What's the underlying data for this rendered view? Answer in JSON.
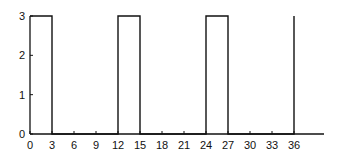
{
  "chart_data": {
    "type": "line",
    "title": "",
    "xlabel": "",
    "ylabel": "",
    "xlim": [
      0,
      40
    ],
    "ylim": [
      0,
      3
    ],
    "grid": false,
    "legend": null,
    "x_ticks": [
      0,
      3,
      6,
      9,
      12,
      15,
      18,
      21,
      24,
      27,
      30,
      33,
      36
    ],
    "y_ticks": [
      0,
      1,
      2,
      3
    ],
    "series": [
      {
        "name": "pulse train",
        "points": [
          [
            0,
            3
          ],
          [
            3,
            3
          ],
          [
            3,
            0
          ],
          [
            12,
            0
          ],
          [
            12,
            3
          ],
          [
            15,
            3
          ],
          [
            15,
            0
          ],
          [
            24,
            0
          ],
          [
            24,
            3
          ],
          [
            27,
            3
          ],
          [
            27,
            0
          ],
          [
            36,
            0
          ],
          [
            36,
            3
          ]
        ]
      }
    ]
  },
  "colors": {
    "line": "#111111",
    "axis": "#111111",
    "background": "#ffffff"
  }
}
